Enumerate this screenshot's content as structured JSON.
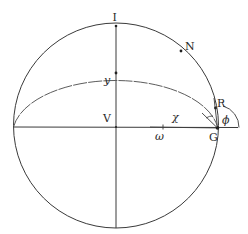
{
  "diagram": {
    "type": "geometric-construction",
    "colors": {
      "stroke": "#3a3a3a",
      "background": "#ffffff"
    },
    "circle": {
      "cx": 116,
      "cy": 125,
      "r": 102
    },
    "labels": {
      "I": "I",
      "N": "N",
      "y": "y",
      "V": "V",
      "chi": "χ",
      "omega": "ω",
      "R": "R",
      "G": "G",
      "phi": "ϕ"
    },
    "points": [
      {
        "name": "I",
        "x": 116,
        "y": 26
      },
      {
        "name": "N",
        "x": 181,
        "y": 51
      },
      {
        "name": "y",
        "x": 116,
        "y": 73
      },
      {
        "name": "V",
        "x": 116,
        "y": 127
      },
      {
        "name": "omega",
        "x": 163,
        "y": 127
      },
      {
        "name": "R",
        "x": 215,
        "y": 108
      },
      {
        "name": "G",
        "x": 217,
        "y": 128
      }
    ]
  }
}
